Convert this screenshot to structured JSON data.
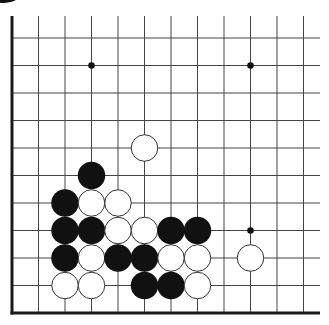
{
  "colors": {
    "background": "#ffffff",
    "grid_line": "#444444",
    "board_edge": "#1a1a1a",
    "black_stone": "#111111",
    "white_stone": "#ffffff",
    "white_stone_outline": "#333333",
    "star_point": "#111111"
  },
  "board": {
    "visible_columns": 12,
    "visible_rows": 11,
    "column_x": [
      12,
      38.5,
      65,
      91.5,
      118,
      144.5,
      171,
      197.5,
      224,
      250.5,
      277,
      303.5
    ],
    "row_y": [
      38,
      65.5,
      93,
      120.5,
      148,
      175.5,
      203,
      230.5,
      258,
      285.5,
      313
    ],
    "top_line_start_y": 16,
    "right_line_end_x": 320,
    "left_edge": true,
    "bottom_edge": true,
    "stone_diameter": 27.5
  },
  "star_points": [
    {
      "col": 3,
      "row": 1
    },
    {
      "col": 9,
      "row": 1
    },
    {
      "col": 9,
      "row": 7
    }
  ],
  "stones": [
    {
      "color": "white",
      "col": 5,
      "row": 4
    },
    {
      "color": "black",
      "col": 3,
      "row": 5
    },
    {
      "color": "black",
      "col": 2,
      "row": 6
    },
    {
      "color": "white",
      "col": 3,
      "row": 6
    },
    {
      "color": "white",
      "col": 4,
      "row": 6
    },
    {
      "color": "black",
      "col": 2,
      "row": 7
    },
    {
      "color": "black",
      "col": 3,
      "row": 7
    },
    {
      "color": "white",
      "col": 4,
      "row": 7
    },
    {
      "color": "white",
      "col": 5,
      "row": 7
    },
    {
      "color": "black",
      "col": 6,
      "row": 7
    },
    {
      "color": "black",
      "col": 7,
      "row": 7
    },
    {
      "color": "black",
      "col": 2,
      "row": 8
    },
    {
      "color": "white",
      "col": 3,
      "row": 8
    },
    {
      "color": "black",
      "col": 4,
      "row": 8
    },
    {
      "color": "black",
      "col": 5,
      "row": 8
    },
    {
      "color": "white",
      "col": 6,
      "row": 8
    },
    {
      "color": "white",
      "col": 7,
      "row": 8
    },
    {
      "color": "white",
      "col": 9,
      "row": 8
    },
    {
      "color": "white",
      "col": 2,
      "row": 9
    },
    {
      "color": "white",
      "col": 3,
      "row": 9
    },
    {
      "color": "black",
      "col": 5,
      "row": 9
    },
    {
      "color": "black",
      "col": 6,
      "row": 9
    },
    {
      "color": "white",
      "col": 7,
      "row": 9
    }
  ],
  "partial_stones": [
    {
      "color": "black",
      "cx": 4,
      "cy": -12,
      "rx": 20,
      "ry": 15
    }
  ]
}
